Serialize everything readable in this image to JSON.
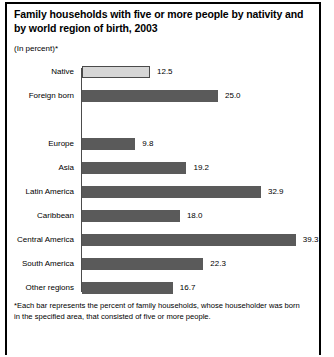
{
  "header": {
    "title": "Family households with five or more people by nativity and by world region of birth, 2003",
    "subtitle": "(In percent)*"
  },
  "footnote": {
    "text": "*Each bar represents the percent of family households, whose householder was born in the specified area, that consisted of five or more people."
  },
  "colors": {
    "bar_dark": "#5a5a5a",
    "bar_light": "#d6d6d6",
    "axis": "#4c4c4c",
    "frame": "#000000"
  },
  "chart_data": {
    "type": "bar",
    "orientation": "horizontal",
    "title": "Family households with five or more people by nativity and by world region of birth, 2003",
    "subtitle": "(In percent)*",
    "xlabel": "",
    "ylabel": "",
    "xlim": [
      0,
      42
    ],
    "grid": false,
    "legend": false,
    "value_format": "one-decimal",
    "categories": [
      "Native",
      "Foreign born",
      "Europe",
      "Asia",
      "Latin America",
      "Caribbean",
      "Central America",
      "South America",
      "Other regions"
    ],
    "values": [
      12.5,
      25.0,
      9.8,
      19.2,
      32.9,
      18.0,
      39.3,
      22.3,
      16.7
    ],
    "value_labels": [
      "12.5",
      "25.0",
      "9.8",
      "19.2",
      "32.9",
      "18.0",
      "39.3",
      "22.3",
      "16.7"
    ],
    "bar_styles": [
      "light",
      "dark",
      "dark",
      "dark",
      "dark",
      "dark",
      "dark",
      "dark",
      "dark"
    ],
    "group_break_after_index": 1,
    "groups": [
      {
        "name": "Nativity",
        "categories": [
          "Native",
          "Foreign born"
        ]
      },
      {
        "name": "World region of birth",
        "categories": [
          "Europe",
          "Asia",
          "Latin America",
          "Caribbean",
          "Central America",
          "South America",
          "Other regions"
        ]
      }
    ]
  }
}
